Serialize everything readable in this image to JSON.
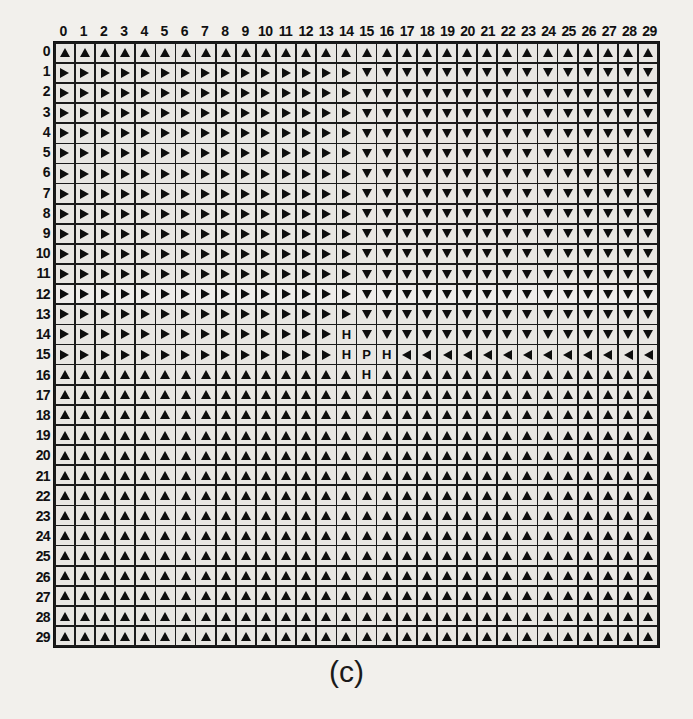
{
  "figure": {
    "caption": "(c)",
    "grid_size": {
      "rows": 30,
      "cols": 30
    },
    "col_headers": [
      "0",
      "1",
      "2",
      "3",
      "4",
      "5",
      "6",
      "7",
      "8",
      "9",
      "10",
      "11",
      "12",
      "13",
      "14",
      "15",
      "16",
      "17",
      "18",
      "19",
      "20",
      "21",
      "22",
      "23",
      "24",
      "25",
      "26",
      "27",
      "28",
      "29"
    ],
    "row_headers": [
      "0",
      "1",
      "2",
      "3",
      "4",
      "5",
      "6",
      "7",
      "8",
      "9",
      "10",
      "11",
      "12",
      "13",
      "14",
      "15",
      "16",
      "17",
      "18",
      "19",
      "20",
      "21",
      "22",
      "23",
      "24",
      "25",
      "26",
      "27",
      "28",
      "29"
    ],
    "colors": {
      "page_background": "#f2f0ec",
      "cell_background": "#e8e6e2",
      "grid_line": "#1a1a1a",
      "glyph": "#0d0d0d"
    },
    "legend": {
      "up": "arrow-up",
      "down": "arrow-down",
      "left": "arrow-left",
      "right": "arrow-right",
      "H": "obstacle-cell",
      "P": "goal-cell"
    }
  },
  "chart_data": {
    "type": "heatmap",
    "title": "(c)",
    "xlabel": "",
    "ylabel": "",
    "categories": [
      "0",
      "1",
      "2",
      "3",
      "4",
      "5",
      "6",
      "7",
      "8",
      "9",
      "10",
      "11",
      "12",
      "13",
      "14",
      "15",
      "16",
      "17",
      "18",
      "19",
      "20",
      "21",
      "22",
      "23",
      "24",
      "25",
      "26",
      "27",
      "28",
      "29"
    ],
    "rows": [
      "0",
      "1",
      "2",
      "3",
      "4",
      "5",
      "6",
      "7",
      "8",
      "9",
      "10",
      "11",
      "12",
      "13",
      "14",
      "15",
      "16",
      "17",
      "18",
      "19",
      "20",
      "21",
      "22",
      "23",
      "24",
      "25",
      "26",
      "27",
      "28",
      "29"
    ],
    "value_codes": {
      "U": "up",
      "D": "down",
      "L": "left",
      "R": "right",
      "H": "H",
      "P": "P"
    },
    "cells": [
      [
        "U",
        "U",
        "U",
        "U",
        "U",
        "U",
        "U",
        "U",
        "U",
        "U",
        "U",
        "U",
        "U",
        "U",
        "U",
        "U",
        "U",
        "U",
        "U",
        "U",
        "U",
        "U",
        "U",
        "U",
        "U",
        "U",
        "U",
        "U",
        "U",
        "U"
      ],
      [
        "R",
        "R",
        "R",
        "R",
        "R",
        "R",
        "R",
        "R",
        "R",
        "R",
        "R",
        "R",
        "R",
        "R",
        "R",
        "D",
        "D",
        "D",
        "D",
        "D",
        "D",
        "D",
        "D",
        "D",
        "D",
        "D",
        "D",
        "D",
        "D",
        "D"
      ],
      [
        "R",
        "R",
        "R",
        "R",
        "R",
        "R",
        "R",
        "R",
        "R",
        "R",
        "R",
        "R",
        "R",
        "R",
        "R",
        "D",
        "D",
        "D",
        "D",
        "D",
        "D",
        "D",
        "D",
        "D",
        "D",
        "D",
        "D",
        "D",
        "D",
        "D"
      ],
      [
        "R",
        "R",
        "R",
        "R",
        "R",
        "R",
        "R",
        "R",
        "R",
        "R",
        "R",
        "R",
        "R",
        "R",
        "R",
        "D",
        "D",
        "D",
        "D",
        "D",
        "D",
        "D",
        "D",
        "D",
        "D",
        "D",
        "D",
        "D",
        "D",
        "D"
      ],
      [
        "R",
        "R",
        "R",
        "R",
        "R",
        "R",
        "R",
        "R",
        "R",
        "R",
        "R",
        "R",
        "R",
        "R",
        "R",
        "D",
        "D",
        "D",
        "D",
        "D",
        "D",
        "D",
        "D",
        "D",
        "D",
        "D",
        "D",
        "D",
        "D",
        "D"
      ],
      [
        "R",
        "R",
        "R",
        "R",
        "R",
        "R",
        "R",
        "R",
        "R",
        "R",
        "R",
        "R",
        "R",
        "R",
        "R",
        "D",
        "D",
        "D",
        "D",
        "D",
        "D",
        "D",
        "D",
        "D",
        "D",
        "D",
        "D",
        "D",
        "D",
        "D"
      ],
      [
        "R",
        "R",
        "R",
        "R",
        "R",
        "R",
        "R",
        "R",
        "R",
        "R",
        "R",
        "R",
        "R",
        "R",
        "R",
        "D",
        "D",
        "D",
        "D",
        "D",
        "D",
        "D",
        "D",
        "D",
        "D",
        "D",
        "D",
        "D",
        "D",
        "D"
      ],
      [
        "R",
        "R",
        "R",
        "R",
        "R",
        "R",
        "R",
        "R",
        "R",
        "R",
        "R",
        "R",
        "R",
        "R",
        "R",
        "D",
        "D",
        "D",
        "D",
        "D",
        "D",
        "D",
        "D",
        "D",
        "D",
        "D",
        "D",
        "D",
        "D",
        "D"
      ],
      [
        "R",
        "R",
        "R",
        "R",
        "R",
        "R",
        "R",
        "R",
        "R",
        "R",
        "R",
        "R",
        "R",
        "R",
        "R",
        "D",
        "D",
        "D",
        "D",
        "D",
        "D",
        "D",
        "D",
        "D",
        "D",
        "D",
        "D",
        "D",
        "D",
        "D"
      ],
      [
        "R",
        "R",
        "R",
        "R",
        "R",
        "R",
        "R",
        "R",
        "R",
        "R",
        "R",
        "R",
        "R",
        "R",
        "R",
        "D",
        "D",
        "D",
        "D",
        "D",
        "D",
        "D",
        "D",
        "D",
        "D",
        "D",
        "D",
        "D",
        "D",
        "D"
      ],
      [
        "R",
        "R",
        "R",
        "R",
        "R",
        "R",
        "R",
        "R",
        "R",
        "R",
        "R",
        "R",
        "R",
        "R",
        "R",
        "D",
        "D",
        "D",
        "D",
        "D",
        "D",
        "D",
        "D",
        "D",
        "D",
        "D",
        "D",
        "D",
        "D",
        "D"
      ],
      [
        "R",
        "R",
        "R",
        "R",
        "R",
        "R",
        "R",
        "R",
        "R",
        "R",
        "R",
        "R",
        "R",
        "R",
        "R",
        "D",
        "D",
        "D",
        "D",
        "D",
        "D",
        "D",
        "D",
        "D",
        "D",
        "D",
        "D",
        "D",
        "D",
        "D"
      ],
      [
        "R",
        "R",
        "R",
        "R",
        "R",
        "R",
        "R",
        "R",
        "R",
        "R",
        "R",
        "R",
        "R",
        "R",
        "R",
        "D",
        "D",
        "D",
        "D",
        "D",
        "D",
        "D",
        "D",
        "D",
        "D",
        "D",
        "D",
        "D",
        "D",
        "D"
      ],
      [
        "R",
        "R",
        "R",
        "R",
        "R",
        "R",
        "R",
        "R",
        "R",
        "R",
        "R",
        "R",
        "R",
        "R",
        "R",
        "D",
        "D",
        "D",
        "D",
        "D",
        "D",
        "D",
        "D",
        "D",
        "D",
        "D",
        "D",
        "D",
        "D",
        "D"
      ],
      [
        "R",
        "R",
        "R",
        "R",
        "R",
        "R",
        "R",
        "R",
        "R",
        "R",
        "R",
        "R",
        "R",
        "R",
        "H",
        "D",
        "D",
        "D",
        "D",
        "D",
        "D",
        "D",
        "D",
        "D",
        "D",
        "D",
        "D",
        "D",
        "D",
        "D"
      ],
      [
        "R",
        "R",
        "R",
        "R",
        "R",
        "R",
        "R",
        "R",
        "R",
        "R",
        "R",
        "R",
        "R",
        "R",
        "H",
        "P",
        "H",
        "L",
        "L",
        "L",
        "L",
        "L",
        "L",
        "L",
        "L",
        "L",
        "L",
        "L",
        "L",
        "L"
      ],
      [
        "U",
        "U",
        "U",
        "U",
        "U",
        "U",
        "U",
        "U",
        "U",
        "U",
        "U",
        "U",
        "U",
        "U",
        "U",
        "H",
        "U",
        "U",
        "U",
        "U",
        "U",
        "U",
        "U",
        "U",
        "U",
        "U",
        "U",
        "U",
        "U",
        "U"
      ],
      [
        "U",
        "U",
        "U",
        "U",
        "U",
        "U",
        "U",
        "U",
        "U",
        "U",
        "U",
        "U",
        "U",
        "U",
        "U",
        "U",
        "U",
        "U",
        "U",
        "U",
        "U",
        "U",
        "U",
        "U",
        "U",
        "U",
        "U",
        "U",
        "U",
        "U"
      ],
      [
        "U",
        "U",
        "U",
        "U",
        "U",
        "U",
        "U",
        "U",
        "U",
        "U",
        "U",
        "U",
        "U",
        "U",
        "U",
        "U",
        "U",
        "U",
        "U",
        "U",
        "U",
        "U",
        "U",
        "U",
        "U",
        "U",
        "U",
        "U",
        "U",
        "U"
      ],
      [
        "U",
        "U",
        "U",
        "U",
        "U",
        "U",
        "U",
        "U",
        "U",
        "U",
        "U",
        "U",
        "U",
        "U",
        "U",
        "U",
        "U",
        "U",
        "U",
        "U",
        "U",
        "U",
        "U",
        "U",
        "U",
        "U",
        "U",
        "U",
        "U",
        "U"
      ],
      [
        "U",
        "U",
        "U",
        "U",
        "U",
        "U",
        "U",
        "U",
        "U",
        "U",
        "U",
        "U",
        "U",
        "U",
        "U",
        "U",
        "U",
        "U",
        "U",
        "U",
        "U",
        "U",
        "U",
        "U",
        "U",
        "U",
        "U",
        "U",
        "U",
        "U"
      ],
      [
        "U",
        "U",
        "U",
        "U",
        "U",
        "U",
        "U",
        "U",
        "U",
        "U",
        "U",
        "U",
        "U",
        "U",
        "U",
        "U",
        "U",
        "U",
        "U",
        "U",
        "U",
        "U",
        "U",
        "U",
        "U",
        "U",
        "U",
        "U",
        "U",
        "U"
      ],
      [
        "U",
        "U",
        "U",
        "U",
        "U",
        "U",
        "U",
        "U",
        "U",
        "U",
        "U",
        "U",
        "U",
        "U",
        "U",
        "U",
        "U",
        "U",
        "U",
        "U",
        "U",
        "U",
        "U",
        "U",
        "U",
        "U",
        "U",
        "U",
        "U",
        "U"
      ],
      [
        "U",
        "U",
        "U",
        "U",
        "U",
        "U",
        "U",
        "U",
        "U",
        "U",
        "U",
        "U",
        "U",
        "U",
        "U",
        "U",
        "U",
        "U",
        "U",
        "U",
        "U",
        "U",
        "U",
        "U",
        "U",
        "U",
        "U",
        "U",
        "U",
        "U"
      ],
      [
        "U",
        "U",
        "U",
        "U",
        "U",
        "U",
        "U",
        "U",
        "U",
        "U",
        "U",
        "U",
        "U",
        "U",
        "U",
        "U",
        "U",
        "U",
        "U",
        "U",
        "U",
        "U",
        "U",
        "U",
        "U",
        "U",
        "U",
        "U",
        "U",
        "U"
      ],
      [
        "U",
        "U",
        "U",
        "U",
        "U",
        "U",
        "U",
        "U",
        "U",
        "U",
        "U",
        "U",
        "U",
        "U",
        "U",
        "U",
        "U",
        "U",
        "U",
        "U",
        "U",
        "U",
        "U",
        "U",
        "U",
        "U",
        "U",
        "U",
        "U",
        "U"
      ],
      [
        "U",
        "U",
        "U",
        "U",
        "U",
        "U",
        "U",
        "U",
        "U",
        "U",
        "U",
        "U",
        "U",
        "U",
        "U",
        "U",
        "U",
        "U",
        "U",
        "U",
        "U",
        "U",
        "U",
        "U",
        "U",
        "U",
        "U",
        "U",
        "U",
        "U"
      ],
      [
        "U",
        "U",
        "U",
        "U",
        "U",
        "U",
        "U",
        "U",
        "U",
        "U",
        "U",
        "U",
        "U",
        "U",
        "U",
        "U",
        "U",
        "U",
        "U",
        "U",
        "U",
        "U",
        "U",
        "U",
        "U",
        "U",
        "U",
        "U",
        "U",
        "U"
      ],
      [
        "U",
        "U",
        "U",
        "U",
        "U",
        "U",
        "U",
        "U",
        "U",
        "U",
        "U",
        "U",
        "U",
        "U",
        "U",
        "U",
        "U",
        "U",
        "U",
        "U",
        "U",
        "U",
        "U",
        "U",
        "U",
        "U",
        "U",
        "U",
        "U",
        "U"
      ],
      [
        "U",
        "U",
        "U",
        "U",
        "U",
        "U",
        "U",
        "U",
        "U",
        "U",
        "U",
        "U",
        "U",
        "U",
        "U",
        "U",
        "U",
        "U",
        "U",
        "U",
        "U",
        "U",
        "U",
        "U",
        "U",
        "U",
        "U",
        "U",
        "U",
        "U"
      ]
    ]
  }
}
